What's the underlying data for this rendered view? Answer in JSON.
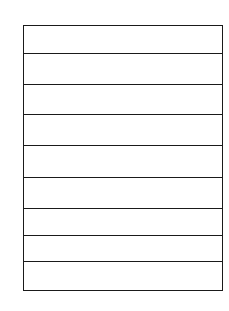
{
  "diagram": {
    "type": "stacked-rows",
    "row_count": 9,
    "rows": [
      {
        "label": ""
      },
      {
        "label": ""
      },
      {
        "label": ""
      },
      {
        "label": ""
      },
      {
        "label": ""
      },
      {
        "label": ""
      },
      {
        "label": ""
      },
      {
        "label": ""
      },
      {
        "label": ""
      }
    ],
    "line_color": "#1a1a1a",
    "background": "#ffffff"
  }
}
